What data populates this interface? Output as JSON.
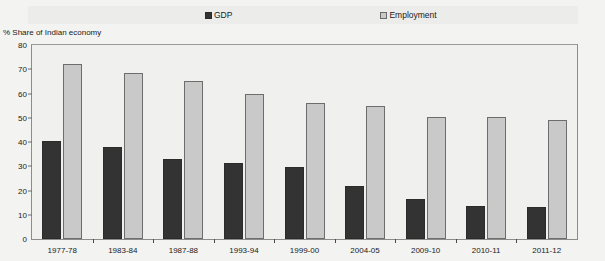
{
  "legend": {
    "items": [
      {
        "label": "GDP",
        "color": "#333333",
        "key": "gdp"
      },
      {
        "label": "Employment",
        "color": "#c9c9c9",
        "key": "emp"
      }
    ]
  },
  "axis": {
    "y_title": "% Share of Indian economy",
    "y_ticks": [
      "0",
      "10",
      "20",
      "30",
      "40",
      "50",
      "60",
      "70",
      "80"
    ]
  },
  "chart_data": {
    "type": "bar",
    "title": "",
    "subtitle": "",
    "xlabel": "",
    "ylabel": "% Share of Indian economy",
    "ylim": [
      0,
      80
    ],
    "ytick_step": 10,
    "grid": false,
    "legend_position": "top",
    "categories": [
      "1977-78",
      "1983-84",
      "1987-88",
      "1993-94",
      "1999-00",
      "2004-05",
      "2009-10",
      "2010-11",
      "2011-12"
    ],
    "series": [
      {
        "name": "GDP",
        "color": "#333333",
        "values": [
          40.5,
          38,
          33,
          31.5,
          29.5,
          22,
          16.5,
          13.5,
          13
        ]
      },
      {
        "name": "Employment",
        "color": "#c9c9c9",
        "values": [
          72,
          68.5,
          65,
          60,
          56,
          55,
          50.5,
          50.5,
          49
        ]
      }
    ]
  }
}
